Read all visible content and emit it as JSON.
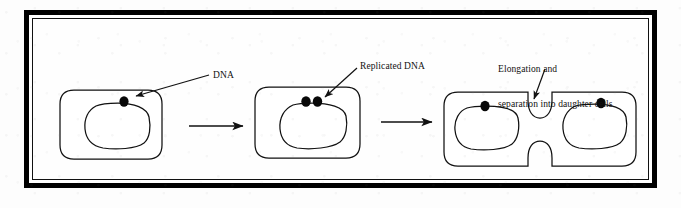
{
  "figure": {
    "background_color": "#fdfdfd",
    "frame_color": "#000000",
    "ink_color": "#111111",
    "stages": [
      {
        "name": "parent-cell",
        "description": "Single cell with one nucleoid and one DNA origin",
        "dna_dots": 1
      },
      {
        "name": "replicated-cell",
        "description": "Cell with replicated DNA, two origins",
        "dna_dots": 2
      },
      {
        "name": "dividing-cell",
        "description": "Elongated cell pinching into two daughter cells",
        "dna_dots": 2
      }
    ],
    "labels": {
      "dna": "DNA",
      "replicated_dna": "Replicated DNA",
      "elongation_line1": "Elongation and",
      "elongation_line2": "separation into daughter cells"
    },
    "arrows": [
      {
        "name": "stage1-to-stage2",
        "direction": "right"
      },
      {
        "name": "stage2-to-stage3",
        "direction": "right"
      }
    ]
  }
}
